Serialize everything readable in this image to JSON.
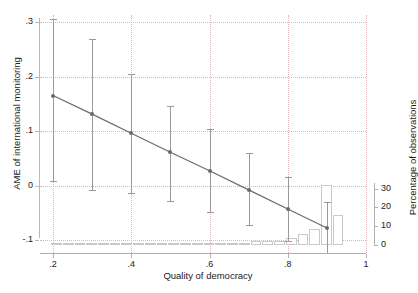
{
  "chart_data": {
    "type": "line",
    "title": "",
    "xlabel": "Quality of democracy",
    "ylabel": "AME of international monitoring",
    "ylabel_right": "Percentage of observations",
    "xlim": [
      0.2,
      1.0
    ],
    "ylim": [
      -0.1,
      0.3
    ],
    "ylim_right": [
      0,
      33
    ],
    "grid": true,
    "legend": "none",
    "xticks": [
      ".2",
      ".4",
      ".6",
      ".8",
      "1"
    ],
    "xtick_values": [
      0.2,
      0.4,
      0.6,
      0.8,
      1.0
    ],
    "yticks": [
      ".3",
      ".2",
      ".1",
      "0",
      "-.1"
    ],
    "ytick_values": [
      0.3,
      0.2,
      0.1,
      0.0,
      -0.1
    ],
    "yticks_right": [
      "30",
      "20",
      "10",
      "0"
    ],
    "ytick_values_right": [
      30,
      20,
      10,
      0
    ],
    "series": [
      {
        "name": "AME of international monitoring",
        "x": [
          0.2,
          0.3,
          0.4,
          0.5,
          0.6,
          0.7,
          0.8,
          0.9
        ],
        "values": [
          0.165,
          0.131,
          0.096,
          0.061,
          0.027,
          -0.008,
          -0.043,
          -0.078
        ],
        "ci_low": [
          0.008,
          -0.008,
          -0.014,
          -0.028,
          -0.048,
          -0.073,
          -0.101,
          -0.124
        ],
        "ci_high": [
          0.305,
          0.268,
          0.204,
          0.146,
          0.103,
          0.059,
          0.016,
          -0.031
        ]
      },
      {
        "name": "Percentage of observations",
        "type": "bar",
        "axis": "right",
        "x": [
          0.21,
          0.24,
          0.27,
          0.3,
          0.33,
          0.36,
          0.39,
          0.42,
          0.45,
          0.48,
          0.51,
          0.54,
          0.57,
          0.6,
          0.63,
          0.66,
          0.69,
          0.72,
          0.75,
          0.78,
          0.81,
          0.84,
          0.87,
          0.9,
          0.93
        ],
        "values": [
          0.3,
          0.4,
          0.3,
          0.3,
          0.4,
          0.3,
          0.5,
          0.4,
          0.6,
          0.9,
          1.1,
          1.2,
          0.9,
          0.7,
          0.6,
          0.5,
          0.4,
          2.2,
          2.4,
          2.1,
          3.8,
          5.6,
          8.6,
          32.0,
          16.2
        ]
      }
    ]
  },
  "axes": {
    "x_title": "Quality of democracy",
    "y_title_left": "AME of international monitoring",
    "y_title_right": "Percentage of observations"
  },
  "colors": {
    "line": "#6b6b6b",
    "error_bar": "#9a9a9a",
    "grid": "#d8b8b8",
    "axis": "#b0b0b0",
    "bar_edge": "#c9c9c9",
    "background": "#ffffff"
  }
}
